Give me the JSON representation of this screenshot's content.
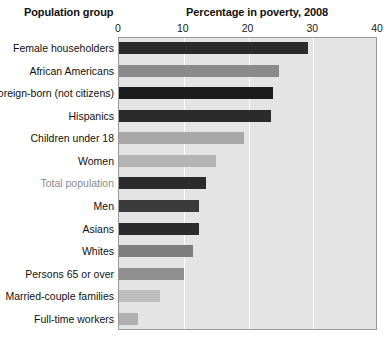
{
  "headers": {
    "left_title": "Population group",
    "chart_title": "Percentage in poverty, 2008"
  },
  "chart_data": {
    "type": "bar",
    "orientation": "horizontal",
    "title": "Percentage in poverty, 2008",
    "xlabel": "Percentage in poverty, 2008",
    "ylabel": "Population group",
    "xlim": [
      0,
      40
    ],
    "xticks": [
      0,
      10,
      20,
      30,
      40
    ],
    "xtick_labels": [
      "0",
      "10",
      "20",
      "30",
      "40"
    ],
    "grid": true,
    "grid_axis": "x",
    "gridline_color": "#fdfdfd",
    "plot_background": "#e4e4e4",
    "legend": null,
    "categories": [
      "Female householders",
      "African Americans",
      "Foreign-born (not citizens)",
      "Hispanics",
      "Children under 18",
      "Women",
      "Total population",
      "Men",
      "Asians",
      "Whites",
      "Persons 65 or over",
      "Married-couple families",
      "Full-time workers"
    ],
    "values": [
      29.2,
      24.7,
      23.8,
      23.5,
      19.3,
      15.0,
      13.5,
      12.3,
      12.3,
      11.4,
      10.0,
      6.3,
      3.0
    ],
    "bar_colors": [
      "#2b2b2b",
      "#8a8a8a",
      "#1c1c1c",
      "#2b2b2b",
      "#a8a8a8",
      "#b4b4b4",
      "#2b2b2b",
      "#3a3a3a",
      "#2b2b2b",
      "#7d7d7d",
      "#8f8f8f",
      "#bdbdbd",
      "#b0b0b0"
    ],
    "label_colors": [
      "#111111",
      "#111111",
      "#111111",
      "#111111",
      "#111111",
      "#111111",
      "#8d8d8d",
      "#111111",
      "#111111",
      "#111111",
      "#111111",
      "#111111",
      "#111111"
    ]
  }
}
